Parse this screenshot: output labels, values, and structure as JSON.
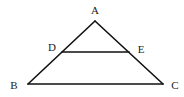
{
  "diagram": {
    "type": "geometry",
    "points": [
      {
        "id": "A",
        "label": "A",
        "x": 95,
        "y": 21,
        "lx": 95,
        "ly": 14
      },
      {
        "id": "B",
        "label": "B",
        "x": 28,
        "y": 84,
        "lx": 14,
        "ly": 89
      },
      {
        "id": "C",
        "label": "C",
        "x": 163,
        "y": 84,
        "lx": 175,
        "ly": 89
      },
      {
        "id": "D",
        "label": "D",
        "x": 62,
        "y": 52,
        "lx": 52,
        "ly": 51
      },
      {
        "id": "E",
        "label": "E",
        "x": 129,
        "y": 52,
        "lx": 141,
        "ly": 53
      }
    ],
    "segments": [
      {
        "from": "A",
        "to": "B"
      },
      {
        "from": "A",
        "to": "C"
      },
      {
        "from": "B",
        "to": "C"
      },
      {
        "from": "D",
        "to": "E"
      }
    ],
    "stroke_color": "#111111",
    "label_color": "#222222"
  }
}
